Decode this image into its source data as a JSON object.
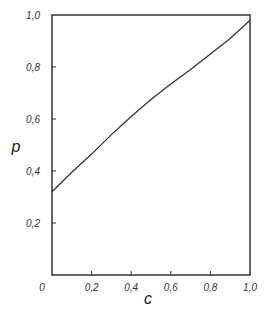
{
  "chart_data": {
    "type": "line",
    "title": "",
    "xlabel": "c",
    "ylabel": "p",
    "xlim": [
      0,
      1.0
    ],
    "ylim": [
      0,
      1.0
    ],
    "grid": false,
    "legend": null,
    "x_ticks": [
      "0",
      "0,2",
      "0,4",
      "0,6",
      "0,8",
      "1,0"
    ],
    "y_ticks": [
      "0,2",
      "0,4",
      "0,6",
      "0,8",
      "1,0"
    ],
    "series": [
      {
        "name": "p(c)",
        "x": [
          0.0,
          0.1,
          0.2,
          0.3,
          0.4,
          0.5,
          0.6,
          0.7,
          0.8,
          0.9,
          1.0
        ],
        "y": [
          0.32,
          0.395,
          0.465,
          0.54,
          0.61,
          0.675,
          0.735,
          0.79,
          0.85,
          0.91,
          0.98
        ]
      }
    ]
  },
  "colors": {
    "axis": "#333333",
    "line": "#333333",
    "background": "#ffffff"
  }
}
